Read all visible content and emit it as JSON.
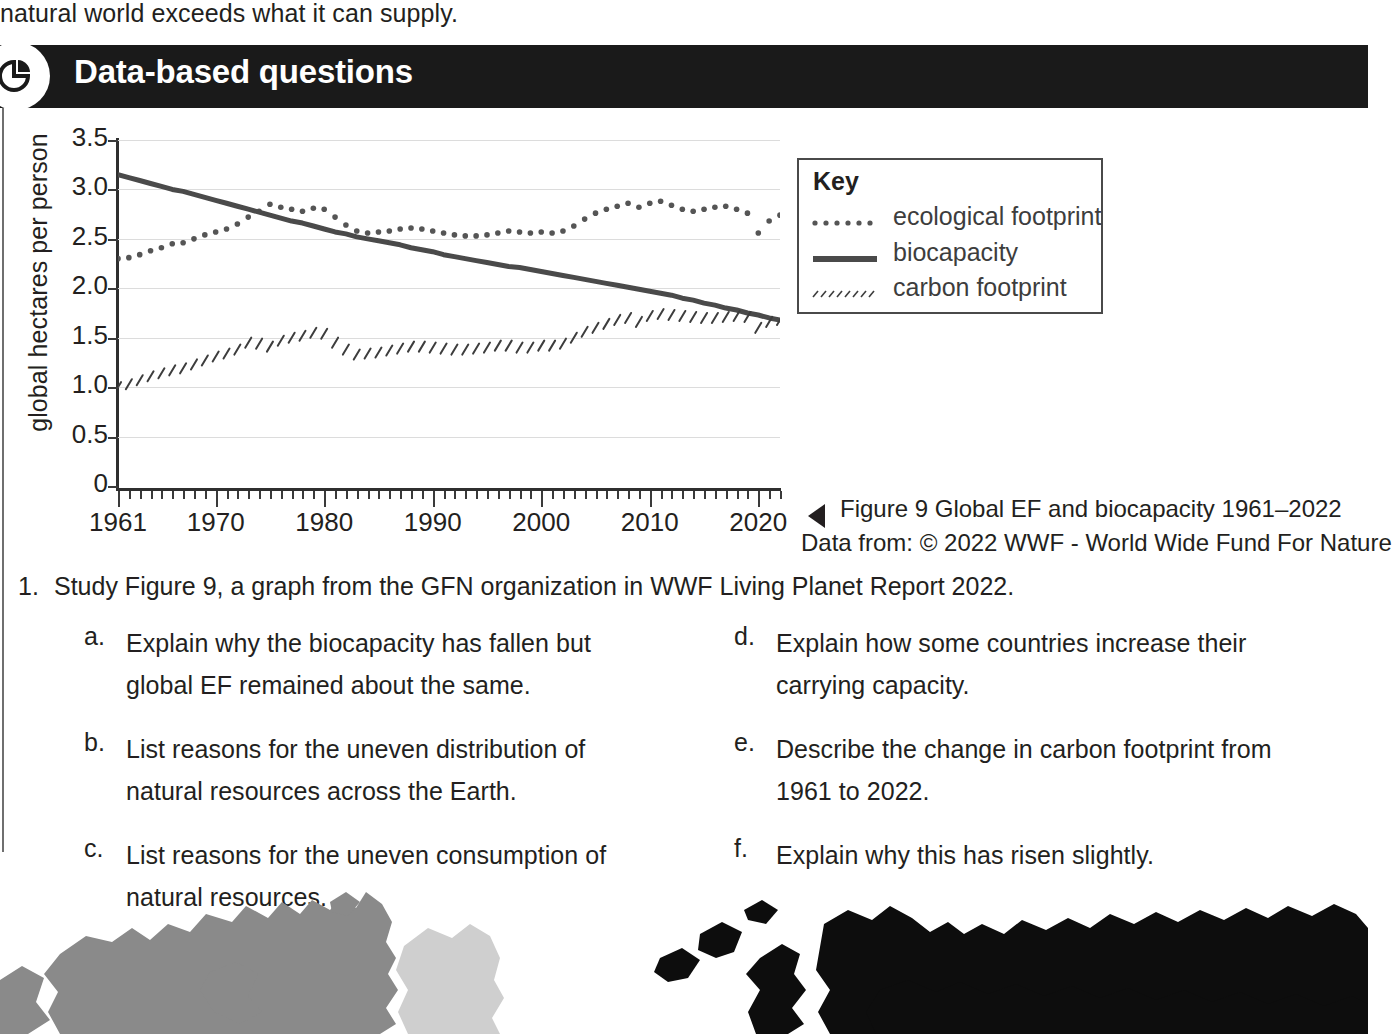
{
  "intro": {
    "text": "natural world exceeds what it can supply."
  },
  "banner": {
    "title": "Data-based questions",
    "icon": "pie-chart-icon",
    "background_color": "#1a1a1a",
    "text_color": "#ffffff"
  },
  "caption": {
    "arrow": "left-triangle-icon",
    "line1": "Figure 9 Global EF and biocapacity 1961–2022",
    "line2": "Data from: © 2022 WWF - World Wide Fund For Nature"
  },
  "legend": {
    "title": "Key",
    "entries": [
      {
        "label": "ecological footprint",
        "style": "dotted"
      },
      {
        "label": "biocapacity",
        "style": "solid"
      },
      {
        "label": "carbon footprint",
        "style": "hatched"
      }
    ]
  },
  "questions": {
    "number": "1.",
    "stem": "Study Figure 9, a graph from the GFN organization in WWF Living Planet Report 2022.",
    "left_column": [
      {
        "label": "a.",
        "text": "Explain why the biocapacity has fallen but global EF remained about the same."
      },
      {
        "label": "b.",
        "text": "List reasons for the uneven distribution of natural resources across the Earth."
      },
      {
        "label": "c.",
        "text": "List reasons for the uneven consumption of natural resources."
      }
    ],
    "right_column": [
      {
        "label": "d.",
        "text": "Explain how some countries increase their carrying capacity."
      },
      {
        "label": "e.",
        "text": "Describe the change in carbon footprint from 1961 to 2022."
      },
      {
        "label": "f.",
        "text": "Explain why this has risen slightly."
      }
    ]
  },
  "chart_data": {
    "type": "line",
    "title": "Figure 9 Global EF and biocapacity 1961–2022",
    "xlabel": "",
    "ylabel": "global hectares per person",
    "xlim": [
      1961,
      2022
    ],
    "ylim": [
      0,
      3.5
    ],
    "grid": true,
    "legend_position": "right",
    "ytick_labels": [
      "0",
      "0.5",
      "1.0",
      "1.5",
      "2.0",
      "2.5",
      "3.0",
      "3.5"
    ],
    "ytick_values": [
      0,
      0.5,
      1.0,
      1.5,
      2.0,
      2.5,
      3.0,
      3.5
    ],
    "xtick_labels": [
      "1961",
      "1970",
      "1980",
      "1990",
      "2000",
      "2010",
      "2020"
    ],
    "xtick_values": [
      1961,
      1970,
      1980,
      1990,
      2000,
      2010,
      2020
    ],
    "x": [
      1961,
      1962,
      1963,
      1964,
      1965,
      1966,
      1967,
      1968,
      1969,
      1970,
      1971,
      1972,
      1973,
      1974,
      1975,
      1976,
      1977,
      1978,
      1979,
      1980,
      1981,
      1982,
      1983,
      1984,
      1985,
      1986,
      1987,
      1988,
      1989,
      1990,
      1991,
      1992,
      1993,
      1994,
      1995,
      1996,
      1997,
      1998,
      1999,
      2000,
      2001,
      2002,
      2003,
      2004,
      2005,
      2006,
      2007,
      2008,
      2009,
      2010,
      2011,
      2012,
      2013,
      2014,
      2015,
      2016,
      2017,
      2018,
      2019,
      2020,
      2021,
      2022
    ],
    "series": [
      {
        "name": "ecological footprint",
        "style": "dotted",
        "color": "#555555",
        "values": [
          2.3,
          2.31,
          2.34,
          2.38,
          2.41,
          2.45,
          2.46,
          2.5,
          2.54,
          2.57,
          2.6,
          2.65,
          2.72,
          2.78,
          2.85,
          2.82,
          2.8,
          2.78,
          2.81,
          2.8,
          2.72,
          2.64,
          2.58,
          2.56,
          2.57,
          2.58,
          2.6,
          2.61,
          2.6,
          2.58,
          2.56,
          2.54,
          2.53,
          2.53,
          2.54,
          2.56,
          2.58,
          2.57,
          2.56,
          2.57,
          2.56,
          2.58,
          2.63,
          2.7,
          2.76,
          2.8,
          2.83,
          2.86,
          2.82,
          2.86,
          2.88,
          2.84,
          2.8,
          2.78,
          2.8,
          2.82,
          2.83,
          2.8,
          2.76,
          2.56,
          2.68,
          2.74
        ]
      },
      {
        "name": "biocapacity",
        "style": "solid",
        "color": "#4a4a4a",
        "values": [
          3.15,
          3.12,
          3.09,
          3.06,
          3.03,
          3.0,
          2.98,
          2.95,
          2.92,
          2.89,
          2.86,
          2.83,
          2.8,
          2.77,
          2.74,
          2.71,
          2.68,
          2.66,
          2.63,
          2.6,
          2.57,
          2.55,
          2.52,
          2.5,
          2.48,
          2.46,
          2.44,
          2.41,
          2.39,
          2.37,
          2.34,
          2.32,
          2.3,
          2.28,
          2.26,
          2.24,
          2.22,
          2.21,
          2.19,
          2.17,
          2.15,
          2.13,
          2.11,
          2.09,
          2.07,
          2.05,
          2.03,
          2.01,
          1.99,
          1.97,
          1.95,
          1.93,
          1.9,
          1.88,
          1.85,
          1.83,
          1.8,
          1.78,
          1.75,
          1.73,
          1.7,
          1.68
        ]
      },
      {
        "name": "carbon footprint",
        "style": "hatched",
        "color": "#3d3d3d",
        "values": [
          1.0,
          1.03,
          1.07,
          1.11,
          1.14,
          1.17,
          1.19,
          1.23,
          1.27,
          1.31,
          1.34,
          1.38,
          1.45,
          1.44,
          1.41,
          1.47,
          1.5,
          1.52,
          1.55,
          1.54,
          1.45,
          1.38,
          1.33,
          1.34,
          1.35,
          1.37,
          1.39,
          1.41,
          1.41,
          1.4,
          1.39,
          1.38,
          1.38,
          1.39,
          1.4,
          1.42,
          1.42,
          1.4,
          1.4,
          1.42,
          1.42,
          1.44,
          1.5,
          1.56,
          1.6,
          1.64,
          1.68,
          1.7,
          1.66,
          1.72,
          1.74,
          1.73,
          1.72,
          1.71,
          1.7,
          1.7,
          1.71,
          1.72,
          1.71,
          1.6,
          1.66,
          1.68
        ]
      }
    ]
  }
}
